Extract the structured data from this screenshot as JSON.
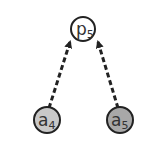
{
  "diagram": {
    "nodes": [
      {
        "id": "p5",
        "base": "p",
        "sub": "5",
        "fill": "#ffffff",
        "stroke": "#222222"
      },
      {
        "id": "a4",
        "base": "a",
        "sub": "4",
        "fill": "#c8c8c8",
        "stroke": "#222222"
      },
      {
        "id": "a5",
        "base": "a",
        "sub": "5",
        "fill": "#a8a8a8",
        "stroke": "#222222"
      }
    ],
    "edges": [
      {
        "from": "a4",
        "to": "p5",
        "style": "dashed"
      },
      {
        "from": "a5",
        "to": "p5",
        "style": "dashed"
      }
    ]
  }
}
